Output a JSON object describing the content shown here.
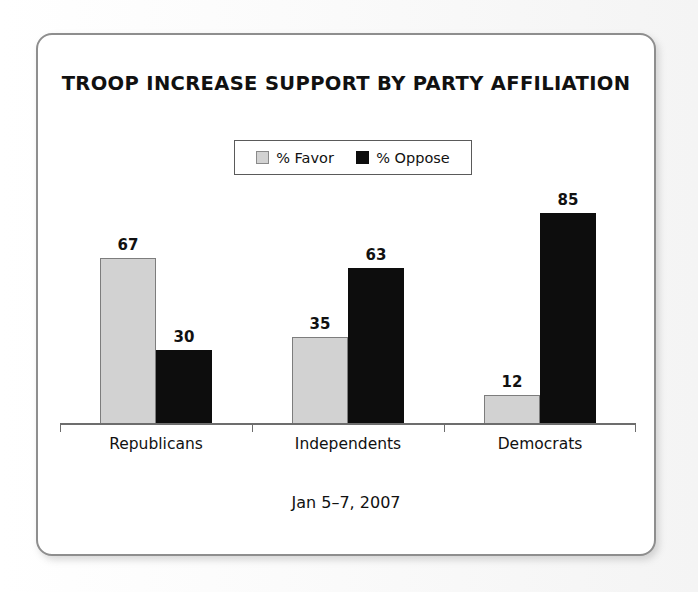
{
  "chart_data": {
    "type": "bar",
    "title": "TROOP INCREASE SUPPORT BY PARTY AFFILIATION",
    "subtitle": "Jan 5–7, 2007",
    "categories": [
      "Republicans",
      "Independents",
      "Democrats"
    ],
    "series": [
      {
        "name": "% Favor",
        "values": [
          67,
          35,
          12
        ],
        "color": "#d2d2d2"
      },
      {
        "name": "% Oppose",
        "values": [
          30,
          63,
          85
        ],
        "color": "#0d0d0d"
      }
    ],
    "xlabel": "",
    "ylabel": "",
    "ylim": [
      0,
      100
    ],
    "grid": false,
    "legend_position": "top-center",
    "axis_visible": "x-only",
    "value_labels": true
  },
  "frame": {
    "border_color": "#8e8e8e",
    "background": "#ffffff"
  },
  "legend": {
    "entries": [
      {
        "label": "% Favor",
        "swatch": "light-gray-square"
      },
      {
        "label": "% Oppose",
        "swatch": "black-square"
      }
    ]
  },
  "bars": {
    "g0": {
      "category": "Republicans",
      "favor": {
        "value": "67",
        "height_px": 167
      },
      "oppose": {
        "value": "30",
        "height_px": 75
      }
    },
    "g1": {
      "category": "Independents",
      "favor": {
        "value": "35",
        "height_px": 88
      },
      "oppose": {
        "value": "63",
        "height_px": 157
      }
    },
    "g2": {
      "category": "Democrats",
      "favor": {
        "value": "12",
        "height_px": 30
      },
      "oppose": {
        "value": "85",
        "height_px": 212
      }
    }
  }
}
